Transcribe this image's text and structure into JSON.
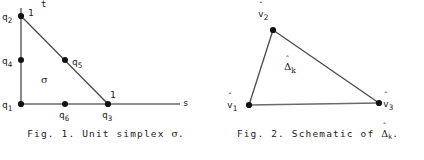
{
  "sheet": {
    "background_color": "#ffffff",
    "ink_color": "#1b1b1b",
    "line_color": "#555555"
  },
  "figures": [
    {
      "id": "fig-1",
      "caption_prefix": "Fig. 1.",
      "caption_text": "Unit simplex",
      "caption_symbol": "σ",
      "caption_terminator": ".",
      "diagram_type": "unit-simplex",
      "axes": [
        {
          "name": "t",
          "label": "t",
          "orientation": "vertical"
        },
        {
          "name": "s",
          "label": "s",
          "orientation": "horizontal"
        }
      ],
      "interior_label": "σ",
      "vertices": [
        {
          "name": "q1",
          "label": "q",
          "subscript": "1",
          "x": 21,
          "y": 104,
          "unit_mark": "",
          "label_side": "left"
        },
        {
          "name": "q2",
          "label": "q",
          "subscript": "2",
          "x": 21,
          "y": 16,
          "unit_mark": "1",
          "label_side": "left"
        },
        {
          "name": "q3",
          "label": "q",
          "subscript": "3",
          "x": 108,
          "y": 104,
          "unit_mark": "1",
          "label_side": "below"
        }
      ],
      "midpoints": [
        {
          "name": "q4",
          "label": "q",
          "subscript": "4",
          "x": 21,
          "y": 60,
          "label_side": "left"
        },
        {
          "name": "q5",
          "label": "q",
          "subscript": "5",
          "x": 65,
          "y": 60,
          "label_side": "right"
        },
        {
          "name": "q6",
          "label": "q",
          "subscript": "6",
          "x": 65,
          "y": 104,
          "label_side": "below"
        }
      ]
    },
    {
      "id": "fig-2",
      "caption_prefix": "Fig. 2.",
      "caption_text": "Schematic of",
      "caption_symbol": "Δ",
      "caption_symbol_hat": "ˆ",
      "caption_symbol_subscript": "k",
      "caption_terminator": ".",
      "diagram_type": "schematic-triangle",
      "interior_label": "Δ",
      "interior_label_hat": "ˆ",
      "interior_label_subscript": "k",
      "vertices": [
        {
          "name": "v1",
          "label": "v",
          "hat": "ˆ",
          "subscript": "1",
          "x": 37,
          "y": 105,
          "label_side": "left"
        },
        {
          "name": "v2",
          "label": "v",
          "hat": "ˆ",
          "subscript": "2",
          "x": 61,
          "y": 30,
          "label_side": "above-left"
        },
        {
          "name": "v3",
          "label": "v",
          "hat": "ˆ",
          "subscript": "3",
          "x": 167,
          "y": 103,
          "label_side": "right"
        }
      ]
    }
  ]
}
